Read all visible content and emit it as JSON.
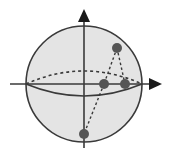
{
  "diagram": {
    "type": "sphere-with-axes",
    "colors": {
      "sphere_fill": "#e4e4e4",
      "stroke": "#3a3a3a",
      "point": "#555555",
      "background": "#ffffff"
    },
    "sphere": {
      "cx": 84,
      "cy": 84,
      "r": 58
    },
    "axes": {
      "vertical": {
        "x": 84,
        "y1": 148,
        "y2": 12,
        "arrow": "up"
      },
      "horizontal": {
        "y": 84,
        "x1": 10,
        "x2": 160,
        "arrow": "right"
      }
    },
    "equator": {
      "back_dashed_top_y": 71,
      "front_solid_bottom_y": 96
    },
    "points": [
      {
        "id": "top",
        "x": 117,
        "y": 48
      },
      {
        "id": "equator-inner",
        "x": 104,
        "y": 84
      },
      {
        "id": "equator-outer",
        "x": 125,
        "y": 84
      },
      {
        "id": "bottom",
        "x": 84,
        "y": 134
      }
    ],
    "dashed_links": [
      {
        "from": "top",
        "to": "equator-inner"
      },
      {
        "from": "top",
        "to": "equator-outer"
      },
      {
        "from": "equator-inner",
        "to": "bottom"
      }
    ]
  }
}
